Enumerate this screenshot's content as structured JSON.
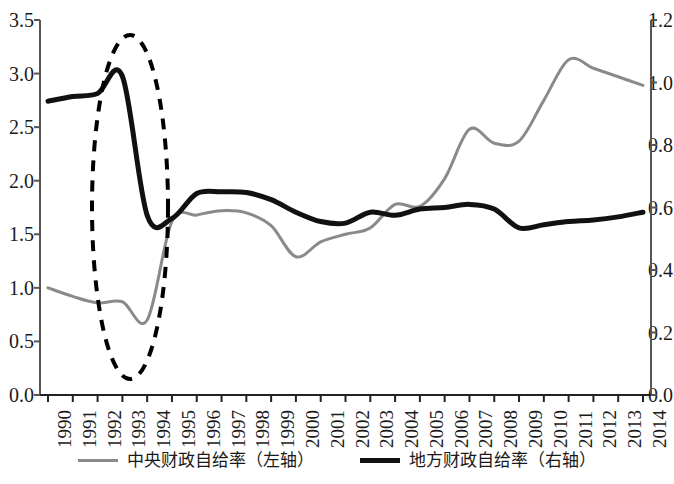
{
  "chart_data": {
    "type": "line",
    "title": "",
    "subtitle": "",
    "xlabel": "",
    "ylabel": "",
    "y2label": "",
    "grid": false,
    "legend_position": "bottom",
    "categories": [
      "1990",
      "1991",
      "1992",
      "1993",
      "1994",
      "1995",
      "1996",
      "1997",
      "1998",
      "1999",
      "2000",
      "2001",
      "2002",
      "2003",
      "2004",
      "2005",
      "2006",
      "2007",
      "2008",
      "2009",
      "2010",
      "2011",
      "2012",
      "2013",
      "2014"
    ],
    "xlim": [
      1990,
      2014
    ],
    "ylim": [
      0.0,
      3.5
    ],
    "y2lim": [
      0.0,
      1.2
    ],
    "yticks": [
      "0.0",
      "0.5",
      "1.0",
      "1.5",
      "2.0",
      "2.5",
      "3.0",
      "3.5"
    ],
    "y2ticks": [
      "0.0",
      "0.2",
      "0.4",
      "0.6",
      "0.8",
      "1.0",
      "1.2"
    ],
    "series": [
      {
        "name": "中央财政自给率（左轴）",
        "axis": "left",
        "color": "#8a8a8a",
        "style": "solid",
        "width": 3,
        "values": [
          1.0,
          0.92,
          0.86,
          0.87,
          0.7,
          1.62,
          1.68,
          1.72,
          1.7,
          1.58,
          1.29,
          1.43,
          1.5,
          1.56,
          1.78,
          1.76,
          2.02,
          2.48,
          2.35,
          2.37,
          2.75,
          3.13,
          3.05,
          2.97,
          2.89
        ]
      },
      {
        "name": "地方财政自给率（右轴）",
        "axis": "right",
        "color": "#111111",
        "style": "solid",
        "width": 5,
        "values": [
          0.94,
          0.955,
          0.965,
          1.02,
          0.575,
          0.565,
          0.645,
          0.65,
          0.648,
          0.625,
          0.585,
          0.555,
          0.55,
          0.585,
          0.575,
          0.595,
          0.6,
          0.61,
          0.595,
          0.535,
          0.545,
          0.555,
          0.56,
          0.57,
          0.585
        ]
      }
    ],
    "annotations": [
      {
        "kind": "ellipse",
        "label": "dashed-highlight-ellipse",
        "x_range": [
          "1992",
          "1995"
        ],
        "style": "dashed",
        "color": "#000000"
      }
    ]
  },
  "legend": {
    "entries": [
      {
        "label": "中央财政自给率（左轴）",
        "marker": "gray-line-marker"
      },
      {
        "label": "地方财政自给率（右轴）",
        "marker": "black-line-marker"
      }
    ]
  }
}
